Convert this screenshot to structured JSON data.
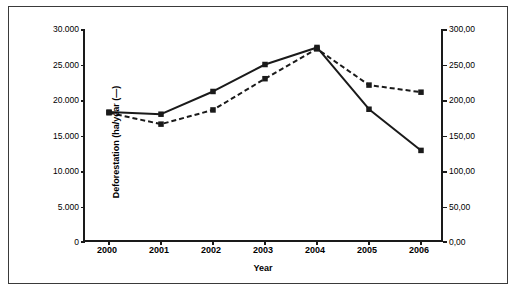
{
  "chart_data": {
    "type": "line",
    "title": "",
    "xlabel": "Year",
    "ylabel": "Deforestation (ha/year (—)",
    "y2label": "Soybean price (US$/ton) (---)",
    "categories": [
      "2000",
      "2001",
      "2002",
      "2003",
      "2004",
      "2005",
      "2006"
    ],
    "ylim": [
      0,
      30000
    ],
    "y2lim": [
      0,
      300
    ],
    "grid": false,
    "legend": "none",
    "series": [
      {
        "name": "Deforestation (ha/year)",
        "axis": "left",
        "style": "solid",
        "marker": "square",
        "color": "#1a1a1a",
        "values": [
          18300,
          18000,
          21200,
          25000,
          27400,
          18700,
          12900
        ]
      },
      {
        "name": "Soybean price (US$/ton)",
        "axis": "right",
        "style": "dashed",
        "marker": "square",
        "color": "#1a1a1a",
        "values": [
          182,
          166,
          186,
          230,
          272,
          221,
          211
        ]
      }
    ],
    "yticks_left": [
      "30.000",
      "25.000",
      "20.000",
      "15.000",
      "10.000",
      "5.000",
      "0"
    ],
    "ytick_values_left": [
      30000,
      25000,
      20000,
      15000,
      10000,
      5000,
      0
    ],
    "yticks_right": [
      "300,00",
      "250,00",
      "200,00",
      "150,00",
      "100,00",
      "50,00",
      "0,00"
    ],
    "ytick_values_right": [
      300,
      250,
      200,
      150,
      100,
      50,
      0
    ]
  }
}
